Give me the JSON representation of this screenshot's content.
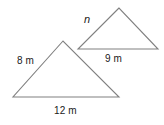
{
  "figure": {
    "background_color": "#ffffff",
    "stroke_color": "#808080",
    "text_color": "#1a1a1a",
    "width": 164,
    "height": 125,
    "small_triangle": {
      "name": "small-triangle",
      "vertices": [
        {
          "label": "apex",
          "x": 119,
          "y": 8
        },
        {
          "label": "bottom-left",
          "x": 78,
          "y": 49
        },
        {
          "label": "bottom-right",
          "x": 158,
          "y": 49
        }
      ],
      "labels": {
        "left_side": "n",
        "base": "9 m"
      }
    },
    "large_triangle": {
      "name": "large-triangle",
      "vertices": [
        {
          "label": "apex",
          "x": 63,
          "y": 41
        },
        {
          "label": "bottom-left",
          "x": 13,
          "y": 97
        },
        {
          "label": "bottom-right",
          "x": 119,
          "y": 97
        }
      ],
      "labels": {
        "left_side": "8 m",
        "base": "12 m"
      }
    }
  }
}
